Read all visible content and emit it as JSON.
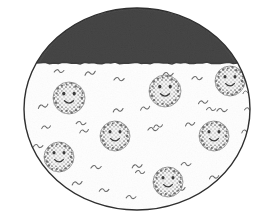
{
  "figure": {
    "title": "Hand-drawn ellipse diagram with shaded cap and stippled smiley-face particles",
    "canvas": {
      "width": 270,
      "height": 219,
      "background": "#ffffff"
    },
    "colors": {
      "outline": "#2f2f2f",
      "cap_fill": "#4f4f4f",
      "cap_fill_dark": "#3d3d3d",
      "body_fill": "#fefefe",
      "squiggle": "#6a6a6a",
      "face_stipple": "#6f6f6f",
      "face_fill": "#f2f2f2",
      "face_feature": "#3a3a3a"
    },
    "container": {
      "label": "outer-ellipse",
      "cx": 137,
      "cy": 109,
      "rx": 113,
      "ry": 101,
      "stroke_width": 1.4
    },
    "cap": {
      "label": "dark-shaded-cap-region",
      "description": "dark charcoal stippled cap occupying the upper portion of the ellipse",
      "baseline_y": 63,
      "top_y": 9
    },
    "faces": [
      {
        "id": "face-1",
        "cx": 69,
        "cy": 98,
        "r": 16,
        "eye_dx": 5.2,
        "eye_dy": -4.4,
        "eye_r": 1.9,
        "mouth_w": 9.0,
        "mouth_dy": 4.0
      },
      {
        "id": "face-2",
        "cx": 165,
        "cy": 91,
        "r": 16,
        "eye_dx": 5.2,
        "eye_dy": -4.4,
        "eye_r": 1.9,
        "mouth_w": 9.0,
        "mouth_dy": 4.0
      },
      {
        "id": "face-3",
        "cx": 230,
        "cy": 81,
        "r": 15,
        "eye_dx": 5.0,
        "eye_dy": -4.2,
        "eye_r": 1.8,
        "mouth_w": 8.6,
        "mouth_dy": 3.8
      },
      {
        "id": "face-4",
        "cx": 115,
        "cy": 136,
        "r": 15,
        "eye_dx": 5.0,
        "eye_dy": -4.2,
        "eye_r": 1.8,
        "mouth_w": 8.6,
        "mouth_dy": 3.8
      },
      {
        "id": "face-5",
        "cx": 214,
        "cy": 136,
        "r": 15,
        "eye_dx": 5.0,
        "eye_dy": -4.2,
        "eye_r": 1.8,
        "mouth_w": 8.6,
        "mouth_dy": 3.8
      },
      {
        "id": "face-6",
        "cx": 59,
        "cy": 157,
        "r": 15,
        "eye_dx": 5.0,
        "eye_dy": -4.2,
        "eye_r": 1.8,
        "mouth_w": 8.6,
        "mouth_dy": 3.8
      },
      {
        "id": "face-7",
        "cx": 168,
        "cy": 182,
        "r": 15,
        "eye_dx": 5.0,
        "eye_dy": -4.2,
        "eye_r": 1.8,
        "mouth_w": 8.6,
        "mouth_dy": 3.8
      }
    ],
    "face_count": 7,
    "squiggles": [
      {
        "x": 61,
        "y": 90,
        "s": 1.0,
        "r": -6
      },
      {
        "x": 59,
        "y": 71,
        "s": 0.9,
        "r": 4
      },
      {
        "x": 43,
        "y": 106,
        "s": 0.95,
        "r": -10
      },
      {
        "x": 38,
        "y": 146,
        "s": 0.9,
        "r": 6
      },
      {
        "x": 46,
        "y": 127,
        "s": 0.85,
        "r": -4
      },
      {
        "x": 47,
        "y": 179,
        "s": 0.95,
        "r": 8
      },
      {
        "x": 77,
        "y": 183,
        "s": 0.95,
        "r": -5
      },
      {
        "x": 81,
        "y": 123,
        "s": 0.9,
        "r": 10
      },
      {
        "x": 84,
        "y": 131,
        "s": 0.85,
        "r": -8
      },
      {
        "x": 96,
        "y": 167,
        "s": 0.95,
        "r": 5
      },
      {
        "x": 90,
        "y": 73,
        "s": 1.0,
        "r": -7
      },
      {
        "x": 104,
        "y": 190,
        "s": 0.9,
        "r": 3
      },
      {
        "x": 119,
        "y": 79,
        "s": 0.95,
        "r": 6
      },
      {
        "x": 118,
        "y": 110,
        "s": 0.95,
        "r": -6
      },
      {
        "x": 131,
        "y": 197,
        "s": 0.9,
        "r": 7
      },
      {
        "x": 137,
        "y": 166,
        "s": 0.95,
        "r": -4
      },
      {
        "x": 140,
        "y": 172,
        "s": 0.85,
        "r": 9
      },
      {
        "x": 145,
        "y": 108,
        "s": 0.9,
        "r": -9
      },
      {
        "x": 153,
        "y": 129,
        "s": 0.95,
        "r": 5
      },
      {
        "x": 158,
        "y": 126,
        "s": 0.85,
        "r": -6
      },
      {
        "x": 168,
        "y": 74,
        "s": 0.95,
        "r": 4
      },
      {
        "x": 180,
        "y": 189,
        "s": 0.95,
        "r": -5
      },
      {
        "x": 186,
        "y": 164,
        "s": 0.9,
        "r": 7
      },
      {
        "x": 190,
        "y": 124,
        "s": 0.9,
        "r": -7
      },
      {
        "x": 197,
        "y": 78,
        "s": 0.95,
        "r": 6
      },
      {
        "x": 203,
        "y": 102,
        "s": 0.9,
        "r": -4
      },
      {
        "x": 211,
        "y": 109,
        "s": 0.85,
        "r": 8
      },
      {
        "x": 214,
        "y": 177,
        "s": 0.9,
        "r": -6
      },
      {
        "x": 222,
        "y": 110,
        "s": 0.95,
        "r": 5
      },
      {
        "x": 246,
        "y": 131,
        "s": 0.85,
        "r": -8
      },
      {
        "x": 249,
        "y": 109,
        "s": 0.85,
        "r": 6
      },
      {
        "x": 247,
        "y": 92,
        "s": 0.8,
        "r": -5
      }
    ]
  }
}
